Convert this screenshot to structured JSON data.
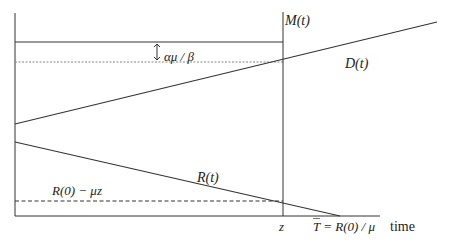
{
  "diagram": {
    "title": "",
    "labels": {
      "M": "M(t)",
      "D": "D(t)",
      "R": "R(t)",
      "gap": "αμ / β",
      "dashed": "R(0) − μz",
      "z_tick": "z",
      "T_tick_bar": "T",
      "T_tick_rest": " = R(0) / μ",
      "x_axis": "time"
    },
    "colors": {
      "line": "#333333",
      "dotted": "#888888",
      "background": "#ffffff"
    },
    "geometry": {
      "y_axis": {
        "x": 15,
        "y1": 13,
        "y2": 216
      },
      "x_axis": {
        "x1": 15,
        "x2": 380,
        "y": 216
      },
      "top_line": {
        "x1": 15,
        "x2": 283,
        "y": 42
      },
      "dotted_line": {
        "x1": 15,
        "x2": 283,
        "y": 62
      },
      "M_vertical": {
        "x": 283,
        "y1": 12,
        "y2": 216
      },
      "D_line": {
        "x1": 15,
        "y1": 124,
        "x2": 437,
        "y2": 22
      },
      "R_line": {
        "x1": 15,
        "y1": 142,
        "x2": 340,
        "y2": 216
      },
      "dashed_line": {
        "x1": 15,
        "x2": 283,
        "y": 201
      },
      "gap_arrow": {
        "x": 157,
        "y1": 42,
        "y2": 62
      }
    }
  }
}
